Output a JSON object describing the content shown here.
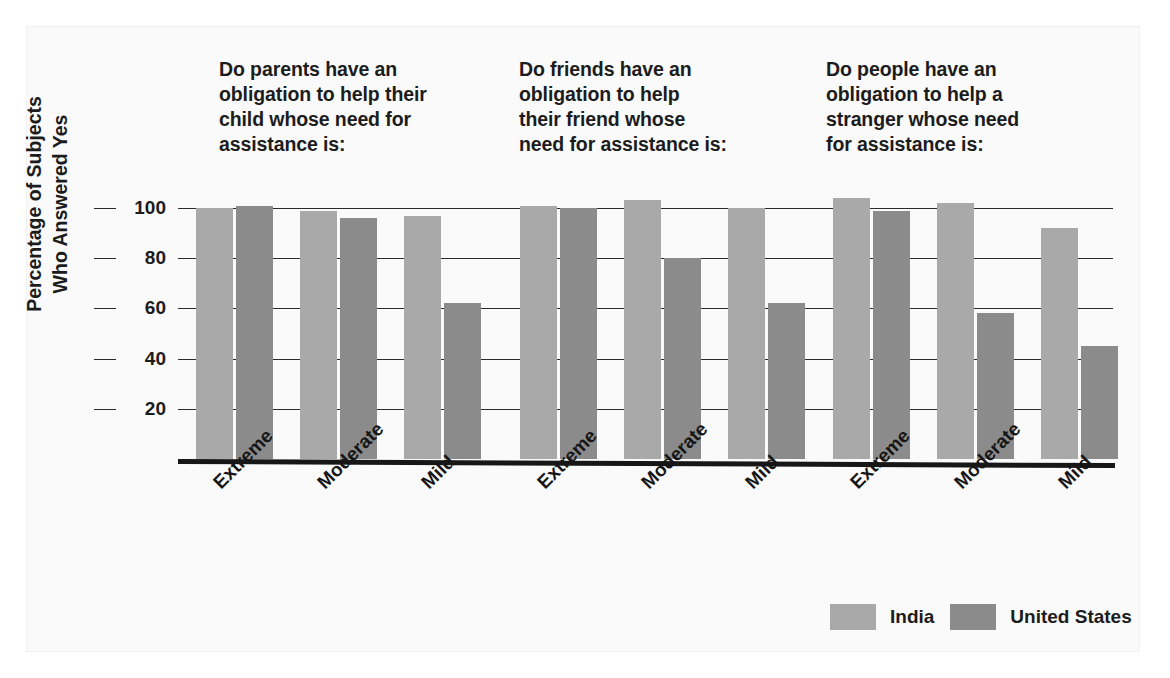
{
  "chart_data": {
    "type": "bar",
    "title": "",
    "subtitle": "",
    "xlabel": "",
    "ylabel": "Percentage of Subjects Who Answered Yes",
    "ylabel_lines": [
      "Percentage of Subjects",
      "Who Answered Yes"
    ],
    "ylim": [
      0,
      105
    ],
    "yticks": [
      20,
      40,
      60,
      80,
      100
    ],
    "ytick_labels": [
      "20",
      "40",
      "60",
      "80",
      "100"
    ],
    "grid": true,
    "legend_position": "bottom-right",
    "categories": [
      "Extreme",
      "Moderate",
      "Mild"
    ],
    "series": [
      {
        "name": "India",
        "color": "#a9a9a9"
      },
      {
        "name": "United States",
        "color": "#8b8b8b"
      }
    ],
    "panels": [
      {
        "heading": "Do parents have an obligation to help their child whose need for assistance is:",
        "heading_lines": [
          "Do parents have an",
          "obligation to help their",
          "child whose need for",
          "assistance is:"
        ],
        "categories": [
          "Extreme",
          "Moderate",
          "Mild"
        ],
        "series": [
          {
            "name": "India",
            "values": [
              100,
              99,
              97
            ]
          },
          {
            "name": "United States",
            "values": [
              101,
              96,
              62
            ]
          }
        ]
      },
      {
        "heading": "Do friends have an obligation to help their friend whose need for assistance is:",
        "heading_lines": [
          "Do friends have an",
          "obligation to help",
          "their friend whose",
          "need for assistance is:"
        ],
        "categories": [
          "Extreme",
          "Moderate",
          "Mild"
        ],
        "series": [
          {
            "name": "India",
            "values": [
              101,
              103,
              100
            ]
          },
          {
            "name": "United States",
            "values": [
              100,
              80,
              62
            ]
          }
        ]
      },
      {
        "heading": "Do people have an obligation to help a stranger whose need for assistance is:",
        "heading_lines": [
          "Do people have an",
          "obligation to help a",
          "stranger whose need",
          "for assistance is:"
        ],
        "categories": [
          "Extreme",
          "Moderate",
          "Mild"
        ],
        "series": [
          {
            "name": "India",
            "values": [
              104,
              102,
              92
            ]
          },
          {
            "name": "United States",
            "values": [
              99,
              58,
              45
            ]
          }
        ]
      }
    ]
  },
  "headings": {
    "q1": "Do parents have an obligation to help their child whose need for assistance is:",
    "q2": "Do friends have an obligation to help their friend whose need for assistance is:",
    "q3": "Do people have an obligation to help a stranger whose need for assistance is:"
  },
  "axis": {
    "y_title_line1": "Percentage of Subjects",
    "y_title_line2": "Who Answered Yes",
    "ticks": [
      "100",
      "80",
      "60",
      "40",
      "20"
    ]
  },
  "legend": {
    "items": [
      {
        "label": "India",
        "color": "#a9a9a9"
      },
      {
        "label": "United States",
        "color": "#8b8b8b"
      }
    ]
  },
  "colors": {
    "india": "#a9a9a9",
    "united_states": "#8b8b8b",
    "axis": "#171717",
    "grid": "#2b2b2b",
    "text": "#1c1c1c",
    "background": "#fafafa"
  }
}
